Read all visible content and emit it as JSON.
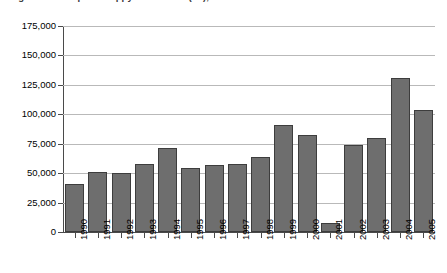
{
  "chart_data": {
    "type": "bar",
    "title": "Afghanistan: Opium Poppy Cultivation (ha), 1990-2005",
    "title_visible_fragment": "Afghanistan: Opium Poppy Cultivation (ha), 1990-2005",
    "title_clipped": true,
    "xlabel": "",
    "ylabel": "",
    "categories": [
      "1990",
      "1991",
      "1992",
      "1993",
      "1994",
      "1995",
      "1996",
      "1997",
      "1998",
      "1999",
      "2000",
      "2001",
      "2002",
      "2003",
      "2004",
      "2005"
    ],
    "values": [
      41000,
      51000,
      50000,
      58000,
      71000,
      54000,
      57000,
      58000,
      64000,
      91000,
      82000,
      8000,
      74000,
      80000,
      131000,
      104000
    ],
    "ylim": [
      0,
      175000
    ],
    "ytick_values": [
      0,
      25000,
      50000,
      75000,
      100000,
      125000,
      150000,
      175000
    ],
    "ytick_labels": [
      "0",
      "25,000",
      "50,000",
      "75,000",
      "100,000",
      "125,000",
      "150,000",
      "175,000"
    ],
    "grid": true,
    "legend": false,
    "legend_position": "none",
    "bar_color": "#6e6e6e",
    "bar_edge_color": "#3d3d3d",
    "gridline_color": "#b9b9b9",
    "axis_color": "#4a4a4a",
    "background_color": "#ffffff",
    "xlabel_rotation": -90
  }
}
